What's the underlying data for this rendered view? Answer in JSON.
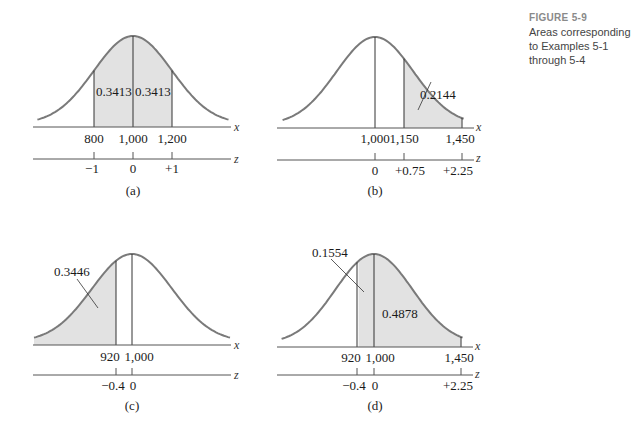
{
  "figure": {
    "title": "FIGURE 5-9",
    "description": "Areas corresponding to Examples 5-1 through 5-4"
  },
  "colors": {
    "curve": "#7a7a7a",
    "shade": "#e2e2e2",
    "axis": "#555555",
    "text": "#1a1a1a"
  },
  "panels": [
    {
      "caption": "(a)",
      "x_ticks": [
        "800",
        "1,000",
        "1,200"
      ],
      "z_ticks": [
        "−1",
        "0",
        "+1"
      ],
      "areas": [
        "0.3413",
        "0.3413"
      ]
    },
    {
      "caption": "(b)",
      "x_ticks": [
        "1,000",
        "1,150",
        "1,450"
      ],
      "z_ticks": [
        "0",
        "+0.75",
        "+2.25"
      ],
      "areas": [
        "0.2144"
      ]
    },
    {
      "caption": "(c)",
      "x_ticks": [
        "920",
        "1,000"
      ],
      "z_ticks": [
        "−0.4",
        "0"
      ],
      "areas": [
        "0.3446"
      ]
    },
    {
      "caption": "(d)",
      "x_ticks": [
        "920",
        "1,000",
        "1,450"
      ],
      "z_ticks": [
        "−0.4",
        "0",
        "+2.25"
      ],
      "areas": [
        "0.1554",
        "0.4878"
      ]
    }
  ],
  "axis_labels": {
    "x": "x",
    "z": "z"
  },
  "chart_data": [
    {
      "type": "area",
      "title": "(a)",
      "distribution": "normal",
      "mean": 1000,
      "sd": 200,
      "shaded_regions": [
        {
          "from_x": 800,
          "to_x": 1000,
          "from_z": -1,
          "to_z": 0,
          "area": 0.3413
        },
        {
          "from_x": 1000,
          "to_x": 1200,
          "from_z": 0,
          "to_z": 1,
          "area": 0.3413
        }
      ],
      "x_ticks": [
        800,
        1000,
        1200
      ],
      "z_ticks": [
        -1,
        0,
        1
      ],
      "xlabel": "x",
      "zlabel": "z"
    },
    {
      "type": "area",
      "title": "(b)",
      "distribution": "normal",
      "mean": 1000,
      "sd": 200,
      "shaded_regions": [
        {
          "from_x": 1150,
          "to_x": 1450,
          "from_z": 0.75,
          "to_z": 2.25,
          "area": 0.2144
        }
      ],
      "x_ticks": [
        1000,
        1150,
        1450
      ],
      "z_ticks": [
        0,
        0.75,
        2.25
      ],
      "xlabel": "x",
      "zlabel": "z"
    },
    {
      "type": "area",
      "title": "(c)",
      "distribution": "normal",
      "mean": 1000,
      "sd": 200,
      "shaded_regions": [
        {
          "from_x": null,
          "to_x": 920,
          "from_z": null,
          "to_z": -0.4,
          "area": 0.3446
        }
      ],
      "x_ticks": [
        920,
        1000
      ],
      "z_ticks": [
        -0.4,
        0
      ],
      "xlabel": "x",
      "zlabel": "z"
    },
    {
      "type": "area",
      "title": "(d)",
      "distribution": "normal",
      "mean": 1000,
      "sd": 200,
      "shaded_regions": [
        {
          "from_x": 920,
          "to_x": 1000,
          "from_z": -0.4,
          "to_z": 0,
          "area": 0.1554
        },
        {
          "from_x": 1000,
          "to_x": 1450,
          "from_z": 0,
          "to_z": 2.25,
          "area": 0.4878
        }
      ],
      "x_ticks": [
        920,
        1000,
        1450
      ],
      "z_ticks": [
        -0.4,
        0,
        2.25
      ],
      "xlabel": "x",
      "zlabel": "z"
    }
  ]
}
